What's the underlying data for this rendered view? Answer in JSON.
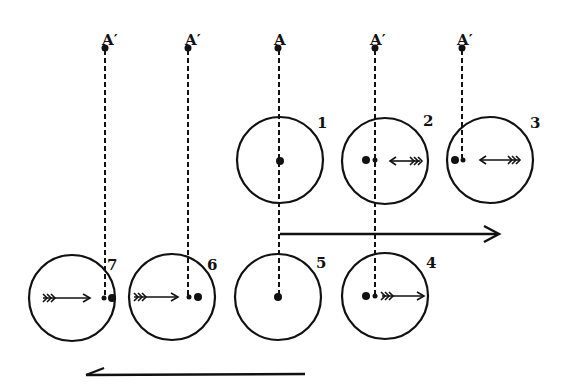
{
  "diagram": {
    "title": "",
    "points": [
      {
        "id": "a1",
        "label": "A′",
        "x": 105,
        "y": 48
      },
      {
        "id": "a2",
        "label": "A′",
        "x": 188,
        "y": 48
      },
      {
        "id": "a0",
        "label": "A",
        "x": 278,
        "y": 48
      },
      {
        "id": "a3",
        "label": "A′",
        "x": 375,
        "y": 48
      },
      {
        "id": "a4",
        "label": "A′",
        "x": 462,
        "y": 48
      }
    ],
    "circles": [
      {
        "id": "c1",
        "label": "1"
      },
      {
        "id": "c2",
        "label": "2"
      },
      {
        "id": "c3",
        "label": "3"
      },
      {
        "id": "c4",
        "label": "4"
      },
      {
        "id": "c5",
        "label": "5"
      },
      {
        "id": "c6",
        "label": "6"
      },
      {
        "id": "c7",
        "label": "7"
      }
    ],
    "arrows": [
      {
        "id": "motion-right",
        "direction": "right"
      },
      {
        "id": "motion-left",
        "direction": "left"
      }
    ],
    "colors": {
      "ink": "#111111",
      "paper": "#ffffff"
    }
  }
}
